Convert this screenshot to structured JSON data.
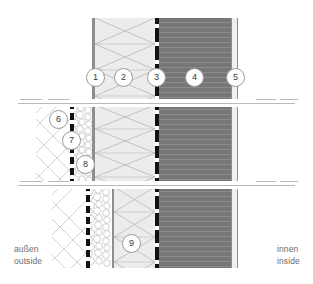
{
  "diagram": {
    "side_labels": {
      "left_line1": "außen",
      "left_line2": "outside",
      "right_line1": "innen",
      "right_line2": "inside"
    },
    "callouts": [
      {
        "id": "1",
        "label": "1",
        "x": 86,
        "y": 68,
        "band": "top"
      },
      {
        "id": "2",
        "label": "2",
        "x": 114,
        "y": 68,
        "band": "top"
      },
      {
        "id": "3",
        "label": "3",
        "x": 147,
        "y": 68,
        "band": "top"
      },
      {
        "id": "4",
        "label": "4",
        "x": 185,
        "y": 68,
        "band": "top"
      },
      {
        "id": "5",
        "label": "5",
        "x": 226,
        "y": 68,
        "band": "top"
      },
      {
        "id": "6",
        "label": "6",
        "x": 49,
        "y": 110,
        "band": "middle"
      },
      {
        "id": "7",
        "label": "7",
        "x": 62,
        "y": 131,
        "band": "middle"
      },
      {
        "id": "8",
        "label": "8",
        "x": 76,
        "y": 155,
        "band": "middle"
      },
      {
        "id": "9",
        "label": "9",
        "x": 122,
        "y": 234,
        "band": "bottom"
      }
    ],
    "layers": [
      {
        "key": "1",
        "name": "outer-render-line",
        "color": "#8e8e8e"
      },
      {
        "key": "2",
        "name": "insulation-layer",
        "color": "#ececec"
      },
      {
        "key": "3",
        "name": "vapour-barrier",
        "color": "#111111"
      },
      {
        "key": "4",
        "name": "concrete-core",
        "color": "#767676"
      },
      {
        "key": "5",
        "name": "inner-finish",
        "color": "#f0f0f0"
      },
      {
        "key": "6",
        "name": "masonry-hatch",
        "color": "#c9c9c9"
      },
      {
        "key": "7",
        "name": "gravel-fill",
        "color": "#cfcfcf"
      },
      {
        "key": "8",
        "name": "sealing-strip",
        "color": "#111111"
      },
      {
        "key": "9",
        "name": "insulation-lower",
        "color": "#ececec"
      }
    ],
    "bands": [
      {
        "name": "top",
        "y": 18,
        "height": 85
      },
      {
        "name": "middle",
        "y": 105,
        "height": 78
      },
      {
        "name": "bottom",
        "y": 187,
        "height": 81
      }
    ],
    "break_lines": [
      {
        "y": 104
      },
      {
        "y": 185
      }
    ]
  }
}
